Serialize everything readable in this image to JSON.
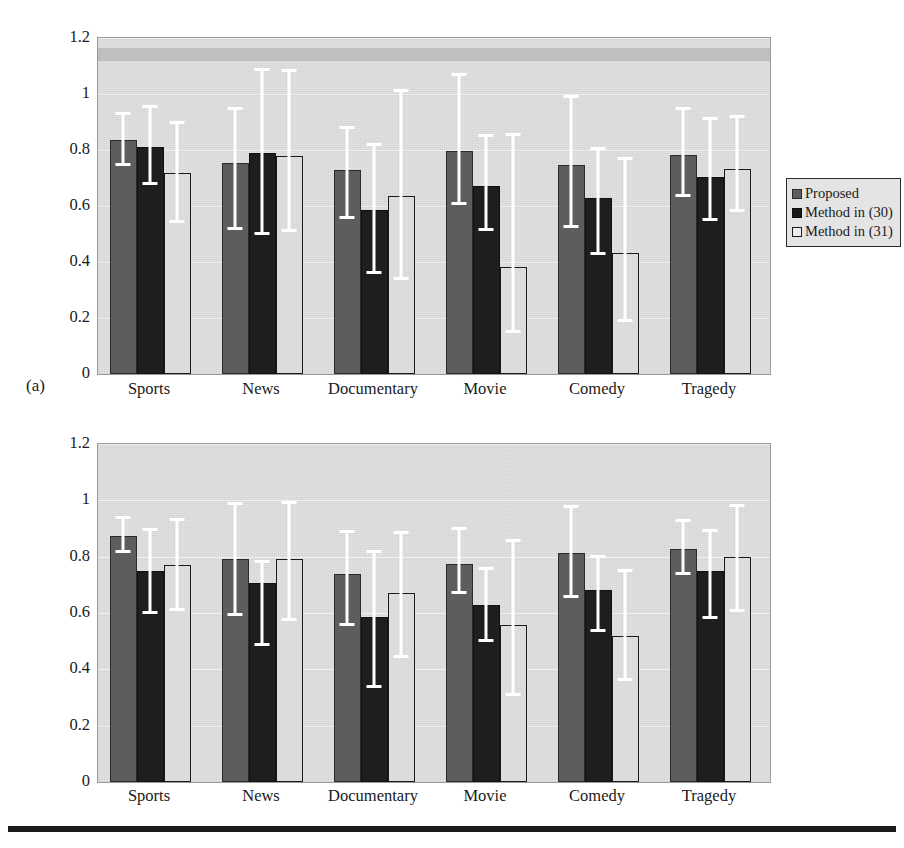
{
  "figure": {
    "bottom_rule": true,
    "panels": [
      {
        "tag": "(a)",
        "ylabel": "Representative capability"
      },
      {
        "tag": "(b)",
        "ylabel": "Representative capability"
      }
    ]
  },
  "legend": {
    "position": "right",
    "entries": [
      {
        "label": "Proposed",
        "color": "#5d5d5d"
      },
      {
        "label": "Method in (30)",
        "color": "#1a1a1a"
      },
      {
        "label": "Method in (31)",
        "color": "#ededed"
      }
    ]
  },
  "chart_data": [
    {
      "type": "bar",
      "title": "(a)",
      "xlabel": "",
      "ylabel": "Representative capability",
      "ylim": [
        0,
        1.2
      ],
      "yticks": [
        "0",
        "0.2",
        "0.4",
        "0.6",
        "0.8",
        "1",
        "1.2"
      ],
      "ytick_values": [
        0,
        0.2,
        0.4,
        0.6,
        0.8,
        1,
        1.2
      ],
      "grid": true,
      "legend_position": "right",
      "categories": [
        "Sports",
        "News",
        "Documentary",
        "Movie",
        "Comedy",
        "Tragedy"
      ],
      "series": [
        {
          "name": "Proposed",
          "color": "#5d5d5d",
          "values": [
            0.835,
            0.752,
            0.728,
            0.795,
            0.745,
            0.783
          ],
          "err_low": [
            0.742,
            0.515,
            0.553,
            0.602,
            0.523,
            0.632
          ],
          "err_high": [
            0.935,
            0.952,
            0.885,
            1.075,
            0.995,
            0.955
          ]
        },
        {
          "name": "Method in (30)",
          "color": "#1a1a1a",
          "values": [
            0.812,
            0.788,
            0.585,
            0.672,
            0.628,
            0.705
          ],
          "err_low": [
            0.675,
            0.495,
            0.357,
            0.512,
            0.425,
            0.545
          ],
          "err_high": [
            0.962,
            1.092,
            0.825,
            0.857,
            0.812,
            0.918
          ]
        },
        {
          "name": "Method in (31)",
          "color": "#ededed",
          "values": [
            0.718,
            0.778,
            0.637,
            0.383,
            0.432,
            0.732
          ],
          "err_low": [
            0.538,
            0.508,
            0.335,
            0.145,
            0.185,
            0.578
          ],
          "err_high": [
            0.905,
            1.088,
            1.018,
            0.862,
            0.775,
            0.925
          ]
        }
      ]
    },
    {
      "type": "bar",
      "title": "(b)",
      "xlabel": "",
      "ylabel": "Representative capability",
      "ylim": [
        0,
        1.2
      ],
      "yticks": [
        "0",
        "0.2",
        "0.4",
        "0.6",
        "0.8",
        "1",
        "1.2"
      ],
      "ytick_values": [
        0,
        0.2,
        0.4,
        0.6,
        0.8,
        1,
        1.2
      ],
      "grid": true,
      "legend_position": "right",
      "categories": [
        "Sports",
        "News",
        "Documentary",
        "Movie",
        "Comedy",
        "Tragedy"
      ],
      "series": [
        {
          "name": "Proposed",
          "color": "#5d5d5d",
          "values": [
            0.875,
            0.792,
            0.738,
            0.775,
            0.812,
            0.828
          ],
          "err_low": [
            0.812,
            0.588,
            0.555,
            0.668,
            0.652,
            0.735
          ],
          "err_high": [
            0.945,
            0.995,
            0.895,
            0.905,
            0.982,
            0.932
          ]
        },
        {
          "name": "Method in (30)",
          "color": "#1a1a1a",
          "values": [
            0.748,
            0.705,
            0.585,
            0.628,
            0.682,
            0.748
          ],
          "err_low": [
            0.598,
            0.482,
            0.332,
            0.498,
            0.532,
            0.578
          ],
          "err_high": [
            0.902,
            0.788,
            0.822,
            0.762,
            0.805,
            0.898
          ]
        },
        {
          "name": "Method in (31)",
          "color": "#ededed",
          "values": [
            0.772,
            0.79,
            0.672,
            0.558,
            0.518,
            0.798
          ],
          "err_low": [
            0.608,
            0.572,
            0.442,
            0.305,
            0.358,
            0.605
          ],
          "err_high": [
            0.938,
            0.998,
            0.892,
            0.862,
            0.755,
            0.988
          ]
        }
      ]
    }
  ]
}
